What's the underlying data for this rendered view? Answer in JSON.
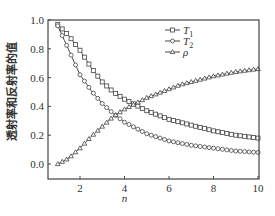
{
  "chart_data": {
    "type": "line",
    "title": "",
    "xlabel": "n",
    "ylabel": "透射率和反射率的值",
    "xlim": [
      0.5,
      10
    ],
    "ylim": [
      -0.1,
      1.0
    ],
    "xticks": [
      2,
      4,
      6,
      8,
      10
    ],
    "yticks": [
      0.0,
      0.2,
      0.4,
      0.6,
      0.8,
      1.0
    ],
    "ytick_labels": [
      "0.0",
      "0.2",
      "0.4",
      "0.6",
      "0.8",
      "1.0"
    ],
    "grid": false,
    "legend_position": "upper center-right",
    "x": [
      1,
      1.5,
      2,
      2.5,
      3,
      3.5,
      4,
      4.5,
      5,
      5.5,
      6,
      6.5,
      7,
      7.5,
      8,
      8.5,
      9,
      9.5,
      10
    ],
    "series": [
      {
        "name": "T1",
        "label_main": "T",
        "label_sub": "1",
        "marker": "square",
        "values": [
          0.97,
          0.89,
          0.79,
          0.67,
          0.57,
          0.5,
          0.45,
          0.41,
          0.37,
          0.34,
          0.31,
          0.29,
          0.27,
          0.25,
          0.23,
          0.215,
          0.2,
          0.19,
          0.18
        ]
      },
      {
        "name": "T2",
        "label_main": "T",
        "label_sub": "2",
        "marker": "circle",
        "values": [
          0.96,
          0.79,
          0.62,
          0.51,
          0.42,
          0.35,
          0.29,
          0.25,
          0.21,
          0.185,
          0.16,
          0.145,
          0.13,
          0.12,
          0.11,
          0.1,
          0.09,
          0.085,
          0.08
        ]
      },
      {
        "name": "rho",
        "label_main": "ρ",
        "label_sub": "",
        "marker": "triangle",
        "values": [
          0.0,
          0.04,
          0.11,
          0.19,
          0.26,
          0.33,
          0.38,
          0.42,
          0.46,
          0.49,
          0.52,
          0.55,
          0.57,
          0.59,
          0.61,
          0.625,
          0.64,
          0.65,
          0.66
        ]
      }
    ]
  }
}
